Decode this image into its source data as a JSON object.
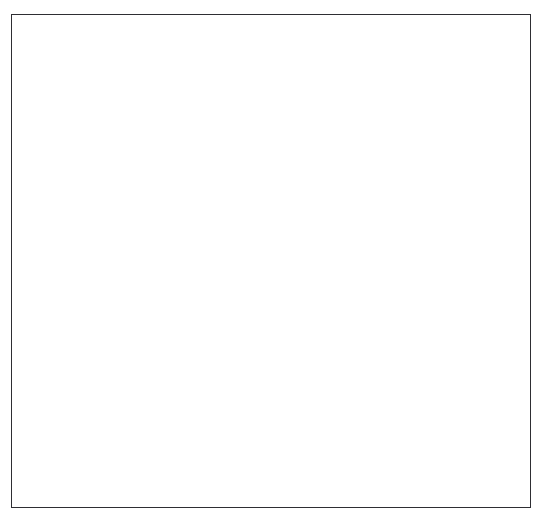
{
  "figure": {
    "domain_type": "anatomical-illustration",
    "title": "Flexed finger — phalanges with flexor and extensor tendons",
    "subject": "finger",
    "view": "lateral / sagittal",
    "style": "grayscale line-and-airbrush medical illustration",
    "background_color": "#ffffff",
    "frame": {
      "visible": true,
      "border_color": "#2e2e33",
      "border_width_px": 1.6,
      "x": 11,
      "y": 14,
      "width": 520,
      "height": 494
    },
    "palette": {
      "outline_dark": "#3a3a40",
      "outline_mid": "#55555c",
      "bone_highlight": "#fbfbfb",
      "bone_light": "#e2e2e2",
      "bone_mid": "#b4b4b4",
      "bone_shadow": "#8c8c8c",
      "bone_deep_shadow": "#6e6e72",
      "tendon_stroke": "#3f3f45",
      "fade_to": "#ffffff"
    },
    "labels": [],
    "annotations": [],
    "parts": [
      {
        "name": "metacarpal",
        "role": "bone",
        "description": "Long horizontal bone entering from right edge, fading out at right",
        "fades_at_right_edge": true
      },
      {
        "name": "metacarpophalangeal-joint",
        "role": "joint",
        "description": "Rounded condylar head of metacarpal articulating with proximal phalanx base"
      },
      {
        "name": "proximal-phalanx",
        "role": "bone",
        "description": "Angles down-left from the MCP joint"
      },
      {
        "name": "proximal-interphalangeal-joint",
        "role": "joint",
        "description": "Mid-finger joint"
      },
      {
        "name": "middle-phalanx",
        "role": "bone",
        "description": "Runs nearly vertical downward"
      },
      {
        "name": "distal-interphalangeal-joint",
        "role": "joint",
        "description": "Joint just above the fingertip bone"
      },
      {
        "name": "distal-phalanx",
        "role": "bone",
        "description": "Tapered tuft-ended tip bone at lower left"
      },
      {
        "name": "extensor-tendon-band",
        "role": "tendon",
        "description": "Pair of lines arcing over the dorsal (upper/outer) side of the finger, fading at right",
        "line_count": 2
      },
      {
        "name": "flexor-tendon-band",
        "role": "tendon",
        "description": "Group of long lines on the volar (lower/inner) side sweeping from lower left to the right edge, fading out",
        "line_count": 4
      },
      {
        "name": "tendon-fade-edge",
        "role": "effect",
        "description": "All tendon lines and the metacarpal dissolve into white near the right border"
      }
    ]
  }
}
